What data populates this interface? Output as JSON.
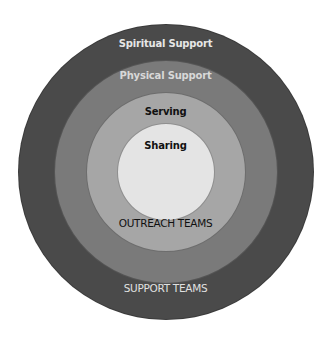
{
  "diagram": {
    "type": "concentric-circles",
    "center": [
      166,
      172
    ],
    "rings": [
      {
        "id": "spiritual-support",
        "label": "Spiritual Support",
        "radius": 148,
        "fill": "#4a4a4a",
        "text_color": "#e6e6e6",
        "label_y": 44
      },
      {
        "id": "physical-support",
        "label": "Physical Support",
        "radius": 112,
        "fill": "#7a7a7a",
        "text_color": "#d8d8d8",
        "label_y": 76
      },
      {
        "id": "serving",
        "label": "Serving",
        "radius": 80,
        "fill": "#a6a6a6",
        "text_color": "#111111",
        "label_y": 112
      },
      {
        "id": "sharing",
        "label": "Sharing",
        "radius": 49,
        "fill": "#e4e4e4",
        "text_color": "#111111",
        "label_y": 146
      }
    ],
    "group_labels": [
      {
        "id": "outreach-teams",
        "label": "OUTREACH TEAMS",
        "color": "#111111",
        "y": 224
      },
      {
        "id": "support-teams",
        "label": "SUPPORT TEAMS",
        "color": "#e0e0e0",
        "y": 289
      }
    ]
  }
}
